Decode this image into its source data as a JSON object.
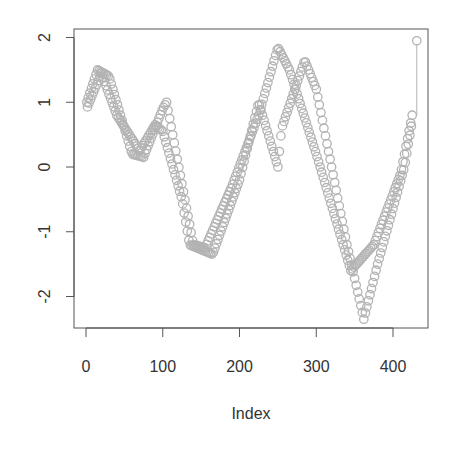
{
  "chart_data": {
    "type": "scatter",
    "title": "",
    "xlabel": "Index",
    "ylabel": "",
    "xlim": [
      -15,
      445
    ],
    "ylim": [
      -2.5,
      2.15
    ],
    "xticks": [
      0,
      100,
      200,
      300,
      400
    ],
    "yticks": [
      -2,
      -1,
      0,
      1,
      2
    ],
    "xtick_labels": [
      "0",
      "100",
      "200",
      "300",
      "400"
    ],
    "ytick_labels": [
      "-2",
      "-1",
      "0",
      "1",
      "2"
    ],
    "grid": false,
    "legend": null,
    "marker": "open-circle",
    "marker_color": "#b3b3b3",
    "n_points_approx": 431,
    "series": [
      {
        "name": "strand-a",
        "keypoints": [
          [
            1,
            1.0
          ],
          [
            15,
            1.5
          ],
          [
            30,
            1.4
          ],
          [
            60,
            0.2
          ],
          [
            75,
            0.15
          ],
          [
            100,
            0.9
          ],
          [
            105,
            1.0
          ],
          [
            140,
            -1.2
          ],
          [
            155,
            -1.25
          ],
          [
            190,
            -0.3
          ],
          [
            225,
            0.8
          ],
          [
            250,
            1.85
          ],
          [
            265,
            1.5
          ],
          [
            300,
            0.2
          ],
          [
            345,
            -1.6
          ],
          [
            375,
            -1.2
          ],
          [
            410,
            -0.1
          ],
          [
            425,
            0.8
          ]
        ]
      },
      {
        "name": "strand-b",
        "keypoints": [
          [
            1,
            0.9
          ],
          [
            20,
            1.45
          ],
          [
            40,
            0.8
          ],
          [
            70,
            0.25
          ],
          [
            90,
            0.65
          ],
          [
            100,
            0.55
          ],
          [
            125,
            -0.5
          ],
          [
            135,
            -1.2
          ],
          [
            165,
            -1.35
          ],
          [
            200,
            -0.2
          ],
          [
            225,
            1.0
          ],
          [
            250,
            0.0
          ],
          [
            255,
            0.6
          ],
          [
            285,
            1.65
          ],
          [
            300,
            1.2
          ],
          [
            340,
            -1.2
          ],
          [
            362,
            -2.35
          ],
          [
            380,
            -1.5
          ],
          [
            415,
            0.0
          ],
          [
            425,
            0.7
          ]
        ]
      }
    ],
    "annotations": [
      {
        "type": "outlier-point",
        "x": 431,
        "y": 1.95
      },
      {
        "type": "segment",
        "from": [
          431,
          0.8
        ],
        "to": [
          431,
          1.9
        ]
      }
    ]
  },
  "axes": {
    "x_title": "Index",
    "y_tick_labels": [
      "2",
      "1",
      "0",
      "-1",
      "-2"
    ],
    "x_tick_labels": [
      "0",
      "100",
      "200",
      "300",
      "400"
    ]
  }
}
